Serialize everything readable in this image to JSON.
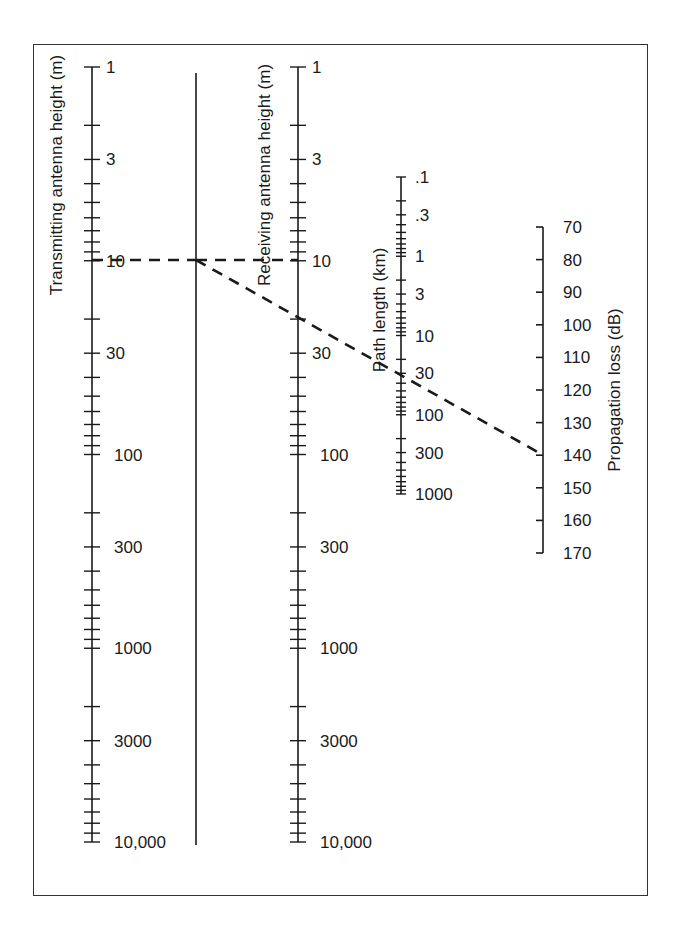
{
  "chart_data": {
    "type": "nomogram",
    "title": "",
    "axes": [
      {
        "id": "tx",
        "name": "Transmitting antenna height (m)",
        "scale": "log",
        "x": 92,
        "y_top": 67,
        "y_bottom": 842,
        "min": 1,
        "max": 10000,
        "tick_side": "both",
        "labels": [
          {
            "value": 1,
            "text": "1"
          },
          {
            "value": 3,
            "text": "3"
          },
          {
            "value": 10,
            "text": "10"
          },
          {
            "value": 30,
            "text": "30"
          },
          {
            "value": 100,
            "text": "100"
          },
          {
            "value": 300,
            "text": "300"
          },
          {
            "value": 1000,
            "text": "1000"
          },
          {
            "value": 3000,
            "text": "3000"
          },
          {
            "value": 10000,
            "text": "10,000"
          }
        ],
        "title_x": 62,
        "title_y": 175
      },
      {
        "id": "pivot",
        "name": "Pivot line (unlabeled)",
        "scale": "none",
        "x": 196,
        "y_top": 73,
        "y_bottom": 845
      },
      {
        "id": "rx",
        "name": "Receiving antenna height (m)",
        "scale": "log",
        "x": 298,
        "y_top": 67,
        "y_bottom": 842,
        "min": 1,
        "max": 10000,
        "tick_side": "both",
        "labels": [
          {
            "value": 1,
            "text": "1"
          },
          {
            "value": 3,
            "text": "3"
          },
          {
            "value": 10,
            "text": "10"
          },
          {
            "value": 30,
            "text": "30"
          },
          {
            "value": 100,
            "text": "100"
          },
          {
            "value": 300,
            "text": "300"
          },
          {
            "value": 1000,
            "text": "1000"
          },
          {
            "value": 3000,
            "text": "3000"
          },
          {
            "value": 10000,
            "text": "10,000"
          }
        ],
        "title_x": 270,
        "title_y": 175
      },
      {
        "id": "path",
        "name": "Path length (km)",
        "scale": "log",
        "x": 401,
        "y_top": 177,
        "y_bottom": 494,
        "min": 0.1,
        "max": 1000,
        "tick_side": "both",
        "labels": [
          {
            "value": 0.1,
            "text": ".1"
          },
          {
            "value": 0.3,
            "text": ".3"
          },
          {
            "value": 1,
            "text": "1"
          },
          {
            "value": 3,
            "text": "3"
          },
          {
            "value": 10,
            "text": "10"
          },
          {
            "value": 30,
            "text": "30"
          },
          {
            "value": 100,
            "text": "100"
          },
          {
            "value": 300,
            "text": "300"
          },
          {
            "value": 1000,
            "text": "1000"
          }
        ],
        "title_x": 385,
        "title_y": 310
      },
      {
        "id": "loss",
        "name": "Propagation loss (dB)",
        "scale": "linear",
        "x": 543,
        "y_top": 227,
        "y_bottom": 553,
        "min": 70,
        "max": 170,
        "tick_side": "left",
        "labels": [
          {
            "value": 70,
            "text": "70"
          },
          {
            "value": 80,
            "text": "80"
          },
          {
            "value": 90,
            "text": "90"
          },
          {
            "value": 100,
            "text": "100"
          },
          {
            "value": 110,
            "text": "110"
          },
          {
            "value": 120,
            "text": "120"
          },
          {
            "value": 130,
            "text": "130"
          },
          {
            "value": 140,
            "text": "140"
          },
          {
            "value": 150,
            "text": "150"
          },
          {
            "value": 160,
            "text": "160"
          },
          {
            "value": 170,
            "text": "170"
          }
        ],
        "title_x": 620,
        "title_y": 390
      }
    ],
    "example_solution": {
      "transmitting_height_m": 10,
      "receiving_height_m": 10,
      "path_length_km": 40,
      "propagation_loss_db": 140,
      "lines": [
        {
          "style": "dashed",
          "points": [
            [
              92,
              260
            ],
            [
              196,
              260
            ]
          ]
        },
        {
          "style": "dashed",
          "points": [
            [
              196,
              260
            ],
            [
              298,
              260
            ]
          ]
        },
        {
          "style": "dashed",
          "points": [
            [
              196,
              260
            ],
            [
              543,
              455
            ]
          ]
        }
      ]
    },
    "legend": null,
    "grid": false
  }
}
